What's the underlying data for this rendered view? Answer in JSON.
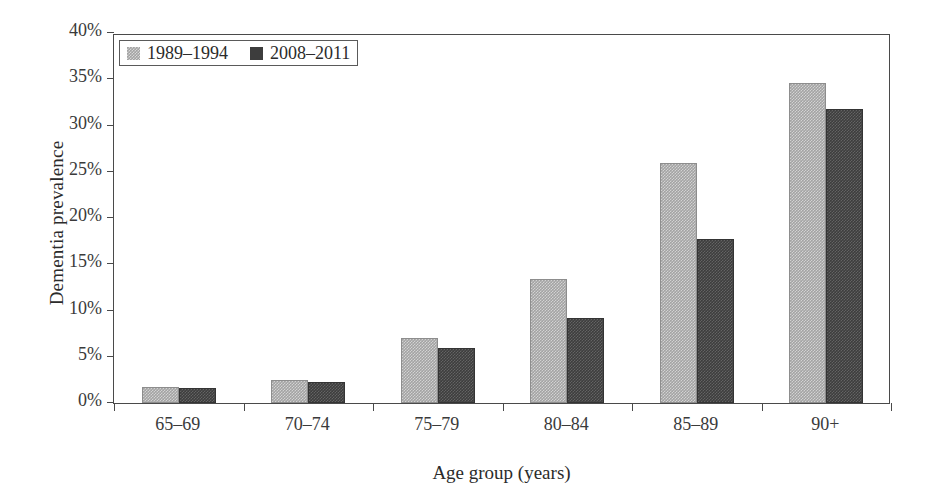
{
  "chart_data": {
    "type": "bar",
    "title": "",
    "subtitle": "",
    "xlabel": "Age group (years)",
    "ylabel": "Dementia prevalence",
    "categories": [
      "65–69",
      "70–74",
      "75–79",
      "80–84",
      "85–89",
      "90+"
    ],
    "series": [
      {
        "name": "1989–1994",
        "color": "#a3a3a3",
        "values": [
          1.7,
          2.5,
          7.0,
          13.4,
          26.0,
          34.6
        ]
      },
      {
        "name": "2008–2011",
        "color": "#3d3d3d",
        "values": [
          1.6,
          2.3,
          5.9,
          9.2,
          17.7,
          31.8
        ]
      }
    ],
    "ylim": [
      0,
      40
    ],
    "ytick_values": [
      0,
      5,
      10,
      15,
      20,
      25,
      30,
      35,
      40
    ],
    "ytick_labels": [
      "0%",
      "5%",
      "10%",
      "15%",
      "20%",
      "25%",
      "30%",
      "35%",
      "40%"
    ],
    "grid": false,
    "legend_position": "top-left",
    "value_unit": "percent"
  },
  "figure": {
    "background_color": "#ffffff",
    "axis_color": "#4a4a4a",
    "text_color": "#2b2b2b"
  }
}
